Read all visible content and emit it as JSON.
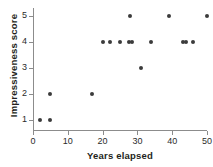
{
  "chart_data": {
    "type": "scatter",
    "title": "",
    "xlabel": "Years elapsed",
    "ylabel": "Impressiveness score",
    "xlim": [
      0,
      50
    ],
    "ylim": [
      0.6,
      5.4
    ],
    "xticks": [
      0,
      10,
      20,
      30,
      40,
      50
    ],
    "yticks": [
      1,
      2,
      3,
      4,
      5
    ],
    "xticklabels": [
      "0",
      "10",
      "20",
      "30",
      "40",
      "50"
    ],
    "yticklabels": [
      "1",
      "2",
      "3",
      "4",
      "5"
    ],
    "grid": false,
    "legend": null,
    "marker_color": "#3b3b3b",
    "axis_color": "#8c8c8c",
    "points": [
      {
        "x": 2,
        "y": 1
      },
      {
        "x": 5,
        "y": 1
      },
      {
        "x": 5,
        "y": 2
      },
      {
        "x": 17,
        "y": 2
      },
      {
        "x": 31,
        "y": 3
      },
      {
        "x": 20,
        "y": 4
      },
      {
        "x": 22,
        "y": 4
      },
      {
        "x": 25,
        "y": 4
      },
      {
        "x": 27.5,
        "y": 4
      },
      {
        "x": 28.5,
        "y": 4
      },
      {
        "x": 34,
        "y": 4
      },
      {
        "x": 43,
        "y": 4
      },
      {
        "x": 44,
        "y": 4
      },
      {
        "x": 46,
        "y": 4
      },
      {
        "x": 28,
        "y": 5
      },
      {
        "x": 39,
        "y": 5
      },
      {
        "x": 50,
        "y": 5
      }
    ]
  }
}
